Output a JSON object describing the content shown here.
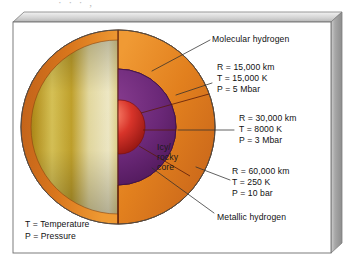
{
  "figure": {
    "type": "cutaway-cross-section",
    "top_partial_text": "· · · ,"
  },
  "callouts": [
    {
      "id": "molecular-hydrogen",
      "label": "Molecular hydrogen"
    },
    {
      "id": "metallic-hydrogen",
      "label": "Metallic hydrogen"
    }
  ],
  "core_label": {
    "line1": "Icy/",
    "line2": "rocky",
    "line3": "core"
  },
  "measurements": [
    {
      "id": "boundary-metallic-core",
      "radius": "R = 15,000 km",
      "temperature": "T = 15,000 K",
      "pressure": "P = 5 Mbar"
    },
    {
      "id": "boundary-molecular-metallic",
      "radius": "R = 30,000 km",
      "temperature": "T = 8000 K",
      "pressure": "P = 3 Mbar"
    },
    {
      "id": "cloud-top-surface",
      "radius": "R = 60,000 km",
      "temperature": "T = 250 K",
      "pressure": "P = 10 bar"
    }
  ],
  "legend": [
    {
      "id": "temperature-key",
      "text": "T = Temperature"
    },
    {
      "id": "pressure-key",
      "text": "P = Pressure"
    }
  ],
  "colors": {
    "cloud_band_light": "#efe3a8",
    "cloud_band_dark": "#a07c18",
    "molecular_hydrogen": "#e07d1c",
    "metallic_hydrogen": "#6b2878",
    "core": "#d32b20",
    "frame_line": "#555555",
    "slab_side": "#9a9a9a",
    "leader_line": "#3a3a3a",
    "panel_background": "#ffffff"
  }
}
